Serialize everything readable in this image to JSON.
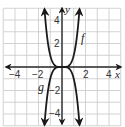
{
  "chart_data": {
    "type": "line",
    "title": "",
    "xlabel": "x",
    "ylabel": "y",
    "xlim": [
      -5,
      5
    ],
    "ylim": [
      -5,
      5
    ],
    "grid": true,
    "x_ticks": [
      {
        "value": -4,
        "label": "−4"
      },
      {
        "value": -2,
        "label": "−2"
      },
      {
        "value": 2,
        "label": "2"
      },
      {
        "value": 4,
        "label": "4"
      }
    ],
    "y_ticks": [
      {
        "value": 4,
        "label": "4"
      },
      {
        "value": 2,
        "label": "2"
      },
      {
        "value": -2,
        "label": "−2"
      },
      {
        "value": -4,
        "label": "−4"
      }
    ],
    "series": [
      {
        "name": "f",
        "description": "upward-opening quartic, flat at origin",
        "x": [
          -1.5,
          -1.25,
          -1,
          -0.75,
          -0.5,
          -0.25,
          0,
          0.25,
          0.5,
          0.75,
          1,
          1.25,
          1.5
        ],
        "values": [
          5.06,
          2.44,
          1,
          0.32,
          0.06,
          0.0,
          0,
          0.0,
          0.06,
          0.32,
          1,
          2.44,
          5.06
        ],
        "label_position": {
          "x": 1.7,
          "y": 2.4
        }
      },
      {
        "name": "g",
        "description": "reflection of f in the x-axis",
        "x": [
          -1.5,
          -1.25,
          -1,
          -0.75,
          -0.5,
          -0.25,
          0,
          0.25,
          0.5,
          0.75,
          1,
          1.25,
          1.5
        ],
        "values": [
          -5.06,
          -2.44,
          -1,
          -0.32,
          -0.06,
          0.0,
          0,
          0.0,
          -0.06,
          -0.32,
          -1,
          -2.44,
          -5.06
        ],
        "label_position": {
          "x": -1.7,
          "y": -1.7
        }
      }
    ],
    "legend": null
  },
  "labels": {
    "x_axis": "x",
    "y_axis": "y",
    "f": "f",
    "g": "g",
    "xt_m4": "−4",
    "xt_m2": "−2",
    "xt_2": "2",
    "xt_4": "4",
    "yt_4": "4",
    "yt_2": "2",
    "yt_m2": "−2",
    "yt_m4": "−4"
  },
  "colors": {
    "grid": "#c8c8c8",
    "axis": "#2a2a2a",
    "curve": "#1a1a1a",
    "background": "#ffffff"
  }
}
